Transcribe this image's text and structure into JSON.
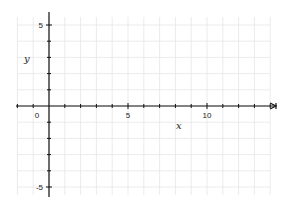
{
  "chart_data": {
    "type": "line",
    "title": "",
    "xlabel": "x",
    "ylabel": "y",
    "xlim": [
      -2,
      14.2
    ],
    "ylim": [
      -5.7,
      5.8
    ],
    "grid": true,
    "x_ticks": [
      0,
      5,
      10
    ],
    "y_ticks": [
      5,
      -5
    ],
    "x_tick_labels": [
      "0",
      "5",
      "10"
    ],
    "y_tick_labels": [
      "5",
      "-5"
    ],
    "series": [],
    "legend": null
  },
  "colors": {
    "axis": "#111111",
    "grid": "#e6e6e6",
    "background": "#ffffff"
  }
}
